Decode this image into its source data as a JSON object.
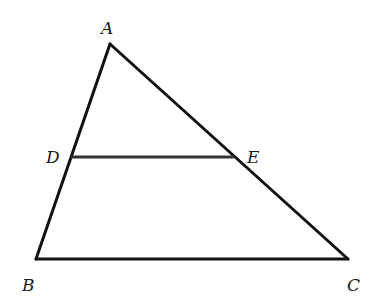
{
  "diagram": {
    "type": "triangle-with-midsegment",
    "stroke_color": "#111111",
    "stroke_width": 3,
    "points": {
      "A": {
        "label": "A",
        "x": 110,
        "y": 44
      },
      "B": {
        "label": "B",
        "x": 36,
        "y": 259
      },
      "C": {
        "label": "C",
        "x": 348,
        "y": 259
      },
      "D": {
        "label": "D",
        "x": 72,
        "y": 157
      },
      "E": {
        "label": "E",
        "x": 233,
        "y": 157
      }
    },
    "segments": [
      {
        "from": "A",
        "to": "B"
      },
      {
        "from": "A",
        "to": "C"
      },
      {
        "from": "B",
        "to": "C"
      },
      {
        "from": "D",
        "to": "E"
      }
    ]
  }
}
